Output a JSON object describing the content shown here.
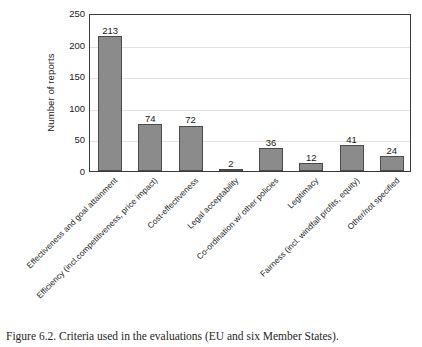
{
  "figure": {
    "caption": "Figure 6.2. Criteria used in the evaluations (EU and six Member States)."
  },
  "chart_data": {
    "type": "bar",
    "title": "",
    "xlabel": "",
    "ylabel": "Number of reports",
    "ylim": [
      0,
      250
    ],
    "ytick_labels": [
      "250",
      "200",
      "150",
      "100",
      "50",
      "0"
    ],
    "ytick_values": [
      250,
      200,
      150,
      100,
      50,
      0
    ],
    "grid": true,
    "legend": "none",
    "bar_color": "#8b8b8b",
    "bar_edge_color": "#4a4a4a",
    "frame_color": "#3b3b3b",
    "gridline_color": "#e2e2e2",
    "categories": [
      "Effectiveness and goal attainment",
      "Efficiency (incl.competitiveness, price impact)",
      "Cost-effectiveness",
      "Legal acceptability",
      "Co-ordination w/ other policies",
      "Legitimacy",
      "Fairness (incl. windfall profits, equity)",
      "Other/not specified"
    ],
    "values": [
      213,
      74,
      72,
      2,
      36,
      12,
      41,
      24
    ],
    "value_labels": [
      "213",
      "74",
      "72",
      "2",
      "36",
      "12",
      "41",
      "24"
    ]
  }
}
